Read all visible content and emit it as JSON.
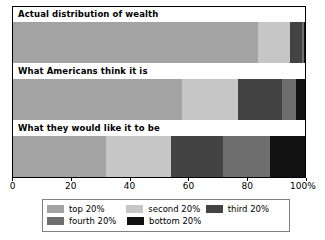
{
  "chart_data": {
    "type": "bar",
    "orientation": "horizontal",
    "stacked": true,
    "normalized": true,
    "title": "",
    "xlabel": "",
    "ylabel": "",
    "xlim": [
      0,
      100
    ],
    "grid": false,
    "legend_position": "bottom",
    "categories": [
      "Actual distribution of wealth",
      "What Americans think it is",
      "What they would like it to be"
    ],
    "series": [
      {
        "name": "top 20%",
        "color": "#a3a3a3",
        "values": [
          84.0,
          58.0,
          32.0
        ]
      },
      {
        "name": "second 20%",
        "color": "#c6c6c6",
        "values": [
          11.0,
          19.0,
          22.0
        ]
      },
      {
        "name": "third 20%",
        "color": "#434343",
        "values": [
          4.0,
          15.0,
          18.0
        ]
      },
      {
        "name": "fourth 20%",
        "color": "#6e6e6e",
        "values": [
          0.6,
          5.0,
          16.0
        ]
      },
      {
        "name": "bottom 20%",
        "color": "#121212",
        "values": [
          0.4,
          3.0,
          12.0
        ]
      }
    ],
    "xticks": [
      0,
      20,
      40,
      60,
      80,
      100
    ],
    "xticklabels": [
      "0",
      "20",
      "40",
      "60",
      "80",
      "100%"
    ]
  },
  "legend": {
    "rows": [
      [
        {
          "label": "top 20%",
          "color": "#a3a3a3"
        },
        {
          "label": "second 20%",
          "color": "#c6c6c6"
        },
        {
          "label": "third 20%",
          "color": "#434343"
        }
      ],
      [
        {
          "label": "fourth 20%",
          "color": "#6e6e6e"
        },
        {
          "label": "bottom 20%",
          "color": "#121212"
        }
      ]
    ]
  }
}
